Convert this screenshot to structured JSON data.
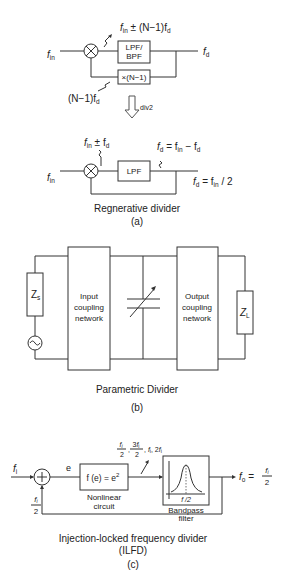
{
  "panel_a": {
    "top": {
      "input": "f",
      "input_sub": "in",
      "mixer_output_f": "f",
      "mixer_output_sub": "in",
      "mixer_output_rest": " ± (N−1)f",
      "mixer_output_sub2": "d",
      "filter_line1": "LPF/",
      "filter_line2": "BPF",
      "multiplier": "×(N−1)",
      "feedback_pre": "(N−1)f",
      "feedback_sub": "d",
      "output": "f",
      "output_sub": "d"
    },
    "arrow_label": "div2",
    "bottom": {
      "input": "f",
      "input_sub": "in",
      "mixer_output_f": "f",
      "mixer_output_sub": "in",
      "mixer_output_rest": " ± f",
      "mixer_output_sub2": "d",
      "filter": "LPF",
      "filter_out_f": "f",
      "filter_out_sub": "d",
      "filter_out_eq": " = f",
      "filter_out_sub2": "in",
      "filter_out_rest": " − f",
      "filter_out_sub3": "d",
      "output_f": "f",
      "output_sub": "d",
      "output_eq": " = f",
      "output_sub2": "in",
      "output_rest": " / 2"
    },
    "caption": "Regnerative divider",
    "label": "(a)"
  },
  "panel_b": {
    "source_impedance": "Z",
    "source_sub": "s",
    "input_network": [
      "Input",
      "coupling",
      "network"
    ],
    "output_network": [
      "Output",
      "coupling",
      "network"
    ],
    "load_impedance": "Z",
    "load_sub": "L",
    "caption": "Parametric Divider",
    "label": "(b)"
  },
  "panel_c": {
    "input": "f",
    "input_sub": "i",
    "error": "e",
    "nonlinear_fn": "f (e) = e",
    "nonlinear_exp": "2",
    "nonlinear_label": [
      "Nonlinear",
      "circuit"
    ],
    "harmonics": [
      "f_i/2",
      "3f_i/2",
      "f_i",
      "2f_i"
    ],
    "bandpass_label": [
      "Bandpass",
      "filter"
    ],
    "bandpass_center": "f /2",
    "output_f": "f",
    "output_sub": "o",
    "output_eq": " = ",
    "feedback_num": "f",
    "feedback_num_sub": "i",
    "feedback_den": "2",
    "caption_line1": "Injection-locked frequency divider",
    "caption_line2": "(ILFD)",
    "label": "(c)"
  }
}
